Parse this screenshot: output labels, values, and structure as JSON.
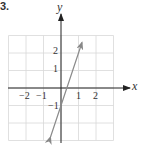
{
  "problem_number": "3.",
  "chart_data": {
    "type": "line",
    "title": "",
    "xlabel": "x",
    "ylabel": "y",
    "xlim": [
      -3,
      3
    ],
    "ylim": [
      -3,
      3
    ],
    "grid": true,
    "x_ticks": [
      "-2",
      "-1",
      "1",
      "2"
    ],
    "y_ticks": [
      "2",
      "1",
      "-1"
    ],
    "series": [
      {
        "name": "y = 3x - 1",
        "x": [
          -0.6,
          0,
          0.333,
          1,
          1.2
        ],
        "y": [
          -2.8,
          -1,
          0,
          2,
          2.6
        ],
        "arrows_both_ends": true,
        "color": "#8a8a8a"
      }
    ]
  }
}
